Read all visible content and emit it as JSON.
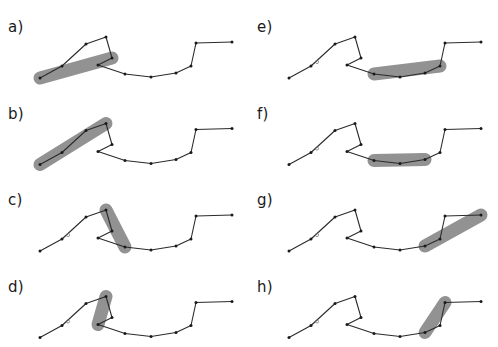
{
  "figure": {
    "background_color": "#ffffff",
    "line_color": "#2b2b2b",
    "vertex_color": "#1a1a1a",
    "highlight_color": "#8c8c8c",
    "label_color": "#1a1a1a",
    "width": 498,
    "height": 347,
    "panel_columns": 2,
    "panel_rows": 4
  },
  "chart_data": {
    "type": "line",
    "xlabel": "",
    "ylabel": "",
    "grid": false,
    "legend": "none",
    "polyline_vertices_left_column": [
      [
        12,
        72
      ],
      [
        34,
        60
      ],
      [
        58,
        38
      ],
      [
        78,
        31
      ],
      [
        84,
        52
      ],
      [
        70,
        59
      ],
      [
        97,
        68
      ],
      [
        123,
        71
      ],
      [
        148,
        67
      ],
      [
        163,
        60
      ],
      [
        168,
        37
      ],
      [
        204,
        36
      ]
    ],
    "polyline_vertices_right_column": [
      [
        12,
        72
      ],
      [
        34,
        60
      ],
      [
        58,
        38
      ],
      [
        78,
        31
      ],
      [
        84,
        52
      ],
      [
        70,
        59
      ],
      [
        97,
        68
      ],
      [
        123,
        71
      ],
      [
        148,
        67
      ],
      [
        163,
        60
      ],
      [
        168,
        37
      ],
      [
        204,
        36
      ]
    ],
    "panels": [
      {
        "id": "a",
        "label": "a)",
        "column": 0,
        "row": 0,
        "highlight_from_vertex": 0,
        "highlight_to_vertex": 4,
        "highlight_points": [
          [
            12,
            72
          ],
          [
            84,
            52
          ]
        ],
        "small_marker": null
      },
      {
        "id": "b",
        "label": "b)",
        "column": 0,
        "row": 1,
        "highlight_from_vertex": 0,
        "highlight_to_vertex": 3,
        "highlight_points": [
          [
            12,
            72
          ],
          [
            78,
            31
          ]
        ],
        "small_marker": null
      },
      {
        "id": "c",
        "label": "c)",
        "column": 0,
        "row": 2,
        "highlight_from_vertex": 3,
        "highlight_to_vertex": 6,
        "highlight_points": [
          [
            78,
            31
          ],
          [
            123,
            71
          ]
        ],
        "small_marker": [
          40,
          56
        ]
      },
      {
        "id": "d",
        "label": "d)",
        "column": 0,
        "row": 3,
        "highlight_from_vertex": 3,
        "highlight_to_vertex": 5,
        "highlight_points": [
          [
            78,
            31
          ],
          [
            70,
            59
          ]
        ],
        "small_marker": [
          40,
          56
        ]
      },
      {
        "id": "e",
        "label": "e)",
        "column": 1,
        "row": 0,
        "highlight_from_vertex": 6,
        "highlight_to_vertex": 9,
        "highlight_points": [
          [
            97,
            68
          ],
          [
            163,
            60
          ]
        ],
        "small_marker": [
          40,
          56
        ]
      },
      {
        "id": "f",
        "label": "f)",
        "column": 1,
        "row": 1,
        "highlight_from_vertex": 6,
        "highlight_to_vertex": 8,
        "highlight_points": [
          [
            97,
            68
          ],
          [
            148,
            67
          ]
        ],
        "small_marker": [
          40,
          56
        ]
      },
      {
        "id": "g",
        "label": "g)",
        "column": 1,
        "row": 2,
        "highlight_from_vertex": 8,
        "highlight_to_vertex": 11,
        "highlight_points": [
          [
            148,
            67
          ],
          [
            204,
            36
          ]
        ],
        "small_marker": [
          40,
          56
        ]
      },
      {
        "id": "h",
        "label": "h)",
        "column": 1,
        "row": 3,
        "highlight_from_vertex": 8,
        "highlight_to_vertex": 10,
        "highlight_points": [
          [
            148,
            67
          ],
          [
            168,
            37
          ]
        ],
        "small_marker": [
          40,
          56
        ]
      }
    ]
  }
}
